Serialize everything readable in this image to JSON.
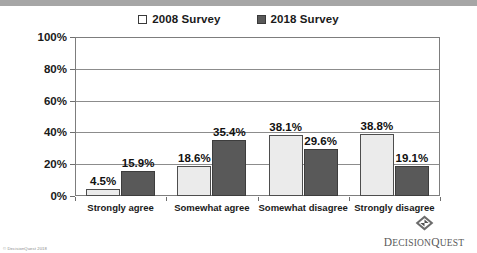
{
  "chart_data": {
    "type": "bar",
    "title": "",
    "xlabel": "",
    "ylabel": "",
    "ylim": [
      0,
      100
    ],
    "yticks": [
      "0%",
      "20%",
      "40%",
      "60%",
      "80%",
      "100%"
    ],
    "ytick_values": [
      0,
      20,
      40,
      60,
      80,
      100
    ],
    "grid": true,
    "legend_position": "top-center",
    "categories": [
      "Strongly agree",
      "Somewhat agree",
      "Somewhat disagree",
      "Strongly disagree"
    ],
    "series": [
      {
        "name": "2008 Survey",
        "color": "#ebebeb",
        "values": [
          4.5,
          18.6,
          38.1,
          38.8
        ],
        "labels": [
          "4.5%",
          "18.6%",
          "38.1%",
          "38.8%"
        ]
      },
      {
        "name": "2018 Survey",
        "color": "#595959",
        "values": [
          15.9,
          35.4,
          29.6,
          19.1
        ],
        "labels": [
          "15.9%",
          "35.4%",
          "29.6%",
          "19.1%"
        ]
      }
    ]
  },
  "footer": {
    "copyright": "© DecisionQuest 2018",
    "logo_name_bold": "D",
    "logo_name_rest": "ECISION",
    "logo_name_bold2": "Q",
    "logo_name_rest2": "UEST"
  }
}
